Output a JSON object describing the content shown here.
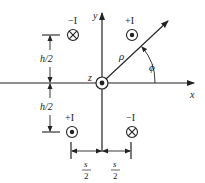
{
  "diagram": {
    "axes": {
      "x_label": "x",
      "y_label": "y",
      "z_label": "z"
    },
    "origin_source": {
      "symbol": "dot-in-circle",
      "label": "z"
    },
    "sources": [
      {
        "position": "upper-left",
        "label": "−I",
        "symbol": "cross-in-circle"
      },
      {
        "position": "upper-right",
        "label": "+I",
        "symbol": "dot-in-circle"
      },
      {
        "position": "lower-left",
        "label": "+I",
        "symbol": "dot-in-circle"
      },
      {
        "position": "lower-right",
        "label": "−I",
        "symbol": "cross-in-circle"
      }
    ],
    "dimensions": {
      "vertical_top": "h/2",
      "vertical_bottom": "h/2",
      "horizontal_left_num": "s",
      "horizontal_left_den": "2",
      "horizontal_right_num": "s",
      "horizontal_right_den": "2"
    },
    "polar": {
      "radius_label": "ρ",
      "angle_label": "ϕ"
    }
  }
}
